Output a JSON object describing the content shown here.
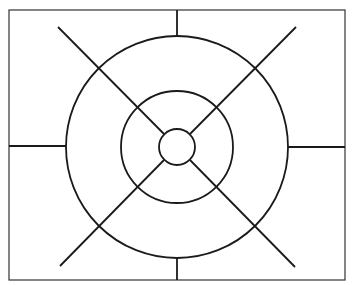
{
  "diagram": {
    "type": "concentric-circles-with-radial-lines",
    "stroke_color": "#1a1a1a",
    "background": "#ffffff",
    "frame": {
      "x": 9,
      "y": 10,
      "width": 336,
      "height": 270
    },
    "center": {
      "x": 177,
      "y": 147
    },
    "circles": [
      {
        "name": "inner",
        "r": 18
      },
      {
        "name": "middle",
        "r": 56
      },
      {
        "name": "outer",
        "r": 111
      }
    ],
    "lines": [
      {
        "name": "top-tick",
        "x1": 177,
        "y1": 10,
        "x2": 177,
        "y2": 36
      },
      {
        "name": "bottom-tick",
        "x1": 177,
        "y1": 258,
        "x2": 177,
        "y2": 280
      },
      {
        "name": "left-tick",
        "x1": 9,
        "y1": 146,
        "x2": 66,
        "y2": 146
      },
      {
        "name": "right-tick",
        "x1": 288,
        "y1": 147,
        "x2": 345,
        "y2": 147
      },
      {
        "name": "diag-nw",
        "x1": 58,
        "y1": 27,
        "x2": 164,
        "y2": 134
      },
      {
        "name": "diag-ne",
        "x1": 296,
        "y1": 27,
        "x2": 190,
        "y2": 134
      },
      {
        "name": "diag-sw",
        "x1": 60,
        "y1": 266,
        "x2": 164,
        "y2": 160
      },
      {
        "name": "diag-se",
        "x1": 295,
        "y1": 267,
        "x2": 190,
        "y2": 160
      }
    ]
  }
}
